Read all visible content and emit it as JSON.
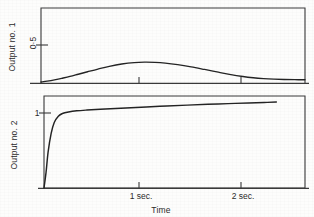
{
  "figure": {
    "background_color": "#fdfdfc",
    "ink_color": "#262626",
    "xlabel": "Time",
    "panels": [
      {
        "id": "output-1",
        "ylabel": "Output no. 1",
        "ytick_label": "0·5",
        "xtick_labels": [
          "",
          ""
        ]
      },
      {
        "id": "output-2",
        "ylabel": "Output no. 2",
        "ytick_label": "1",
        "xtick_labels": [
          "1 sec.",
          "2 sec."
        ]
      }
    ]
  },
  "chart_data": [
    {
      "type": "line",
      "title": "",
      "xlabel": "Time",
      "ylabel": "Output no. 1",
      "xlim": [
        0,
        2.55
      ],
      "ylim": [
        0,
        0.72
      ],
      "xticks": [
        1,
        2
      ],
      "xtick_labels": [
        "",
        ""
      ],
      "yticks": [
        0.5
      ],
      "ytick_labels": [
        "0·5"
      ],
      "grid": false,
      "legend": "none",
      "x": [
        0.0,
        0.06,
        0.13,
        0.2,
        0.28,
        0.36,
        0.45,
        0.55,
        0.66,
        0.78,
        0.9,
        1.0,
        1.1,
        1.2,
        1.32,
        1.45,
        1.58,
        1.7,
        1.82,
        1.95,
        2.05,
        2.15,
        2.25,
        2.35,
        2.45,
        2.55
      ],
      "y": [
        0.01,
        0.018,
        0.03,
        0.045,
        0.063,
        0.084,
        0.108,
        0.134,
        0.16,
        0.182,
        0.196,
        0.2,
        0.198,
        0.191,
        0.176,
        0.155,
        0.13,
        0.106,
        0.083,
        0.062,
        0.05,
        0.042,
        0.037,
        0.034,
        0.032,
        0.031
      ]
    },
    {
      "type": "line",
      "title": "",
      "xlabel": "Time",
      "ylabel": "Output no. 2",
      "xlim": [
        0,
        2.55
      ],
      "ylim": [
        0,
        1.18
      ],
      "xticks": [
        1,
        2
      ],
      "xtick_labels": [
        "1 sec.",
        "2 sec."
      ],
      "yticks": [
        1
      ],
      "ytick_labels": [
        "1"
      ],
      "grid": false,
      "legend": "none",
      "x": [
        0.0,
        0.02,
        0.04,
        0.07,
        0.1,
        0.14,
        0.18,
        0.24,
        0.32,
        0.42,
        0.55,
        0.7,
        0.85,
        1.0,
        1.2,
        1.4,
        1.6,
        1.8,
        2.0,
        2.15,
        2.27
      ],
      "y": [
        0.0,
        0.2,
        0.46,
        0.7,
        0.84,
        0.92,
        0.955,
        0.975,
        0.99,
        1.0,
        1.01,
        1.02,
        1.03,
        1.04,
        1.052,
        1.063,
        1.073,
        1.082,
        1.091,
        1.097,
        1.102
      ]
    }
  ]
}
